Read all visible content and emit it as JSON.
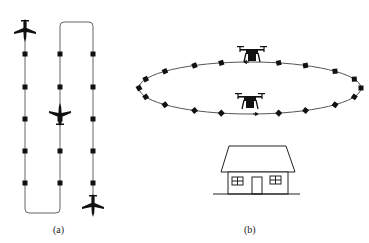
{
  "panels": {
    "a": {
      "label": "(a)",
      "description": "Lawnmower (boustrophedon) flight path with fixed-wing aircraft",
      "columns_x": [
        25,
        60,
        93
      ],
      "waypoints_y": [
        54,
        87,
        119,
        151,
        183
      ],
      "route_top_y": 22,
      "route_bottom_y": 213,
      "aircraft": [
        {
          "name": "aircraft-start",
          "x": 25,
          "y": 30,
          "heading": "down"
        },
        {
          "name": "aircraft-middle",
          "x": 60,
          "y": 115,
          "heading": "up"
        },
        {
          "name": "aircraft-end",
          "x": 93,
          "y": 205,
          "heading": "down"
        }
      ]
    },
    "b": {
      "label": "(b)",
      "description": "Circular orbit of quadcopter drones around a house",
      "orbit": {
        "cx": 250,
        "cy": 88,
        "rx": 111,
        "ry": 26
      },
      "waypoint_angles_deg": [
        180,
        160,
        140,
        120,
        105,
        75,
        60,
        40,
        20,
        0,
        340,
        320,
        300,
        285,
        255,
        240,
        220,
        200
      ],
      "drones": [
        {
          "name": "drone-top",
          "x": 252,
          "y": 55,
          "heading": "left"
        },
        {
          "name": "drone-bottom",
          "x": 250,
          "y": 102,
          "heading": "right"
        }
      ],
      "house": {
        "roof_top_y": 145,
        "eave_y": 170,
        "ground_y": 194
      }
    }
  },
  "colors": {
    "stroke": "#555555",
    "fill": "#111111",
    "background": "#ffffff"
  }
}
